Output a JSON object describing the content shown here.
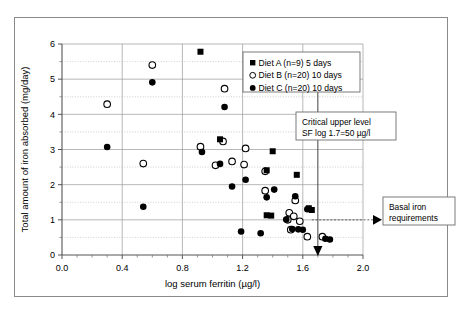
{
  "figure": {
    "background": "#ffffff",
    "border_color": "#8a8a8a"
  },
  "chart_data": {
    "type": "scatter",
    "title": "",
    "xlabel": "log serum ferritin (µg/l)",
    "ylabel": "Total amount of iron absorbed (mg/day)",
    "xlim": [
      0.0,
      2.0
    ],
    "ylim": [
      0,
      6
    ],
    "xticks": [
      0.0,
      0.4,
      0.8,
      1.2,
      1.6,
      2.0
    ],
    "xticklabels": [
      "0.0",
      "0.4",
      "0.8",
      "1.2",
      "1.6",
      "2.0"
    ],
    "x_minor_tick_step": 0.1,
    "yticks": [
      0,
      1,
      2,
      3,
      4,
      5,
      6
    ],
    "yticklabels": [
      "0",
      "1",
      "2",
      "3",
      "4",
      "5",
      "6"
    ],
    "y_minor_gridline_step": 0.5,
    "grid": "major x and y solid, minor y dotted",
    "legend_position": "top-right inside plot",
    "marker_color": "#000000",
    "series": [
      {
        "name": "Diet A (n=9) 5 days",
        "marker": "filled-square",
        "points": [
          [
            0.92,
            5.78
          ],
          [
            1.05,
            3.29
          ],
          [
            1.4,
            2.95
          ],
          [
            1.36,
            2.41
          ],
          [
            1.56,
            2.28
          ],
          [
            1.39,
            1.12
          ],
          [
            1.36,
            1.13
          ],
          [
            1.64,
            1.33
          ],
          [
            1.66,
            1.28
          ]
        ]
      },
      {
        "name": "Diet B (n=20) 10 days",
        "marker": "open-circle",
        "points": [
          [
            0.6,
            5.4
          ],
          [
            1.08,
            4.73
          ],
          [
            0.3,
            4.29
          ],
          [
            1.07,
            3.23
          ],
          [
            0.92,
            3.08
          ],
          [
            1.22,
            3.03
          ],
          [
            1.13,
            2.66
          ],
          [
            0.54,
            2.6
          ],
          [
            1.21,
            2.57
          ],
          [
            1.02,
            2.55
          ],
          [
            1.35,
            2.38
          ],
          [
            1.35,
            1.83
          ],
          [
            1.55,
            1.55
          ],
          [
            1.51,
            1.2
          ],
          [
            1.54,
            1.1
          ],
          [
            1.5,
            1.0
          ],
          [
            1.58,
            0.96
          ],
          [
            1.52,
            0.72
          ],
          [
            1.63,
            0.52
          ],
          [
            1.73,
            0.52
          ]
        ]
      },
      {
        "name": "Diet C (n=20) 10 days",
        "marker": "filled-circle",
        "points": [
          [
            0.6,
            4.91
          ],
          [
            1.08,
            4.21
          ],
          [
            0.3,
            3.07
          ],
          [
            0.93,
            2.93
          ],
          [
            1.05,
            2.59
          ],
          [
            1.22,
            2.14
          ],
          [
            1.13,
            1.95
          ],
          [
            1.41,
            1.86
          ],
          [
            1.36,
            1.64
          ],
          [
            1.55,
            1.67
          ],
          [
            0.54,
            1.37
          ],
          [
            1.63,
            1.3
          ],
          [
            1.49,
            1.01
          ],
          [
            1.53,
            0.74
          ],
          [
            1.57,
            0.73
          ],
          [
            1.6,
            0.72
          ],
          [
            1.19,
            0.67
          ],
          [
            1.32,
            0.62
          ],
          [
            1.75,
            0.46
          ],
          [
            1.78,
            0.44
          ]
        ]
      }
    ],
    "annotations": [
      {
        "id": "critical-upper-level",
        "lines": [
          "Critical upper level",
          "SF log 1.7=50 µg/l"
        ],
        "reference_line": {
          "type": "vertical",
          "x": 1.7,
          "marker": "down-triangle-at-axis"
        }
      },
      {
        "id": "basal-iron-requirements",
        "lines": [
          "Basal iron",
          "requirements"
        ],
        "reference_line": {
          "type": "horizontal",
          "y": 1.0,
          "marker": "right-triangle"
        }
      }
    ]
  }
}
